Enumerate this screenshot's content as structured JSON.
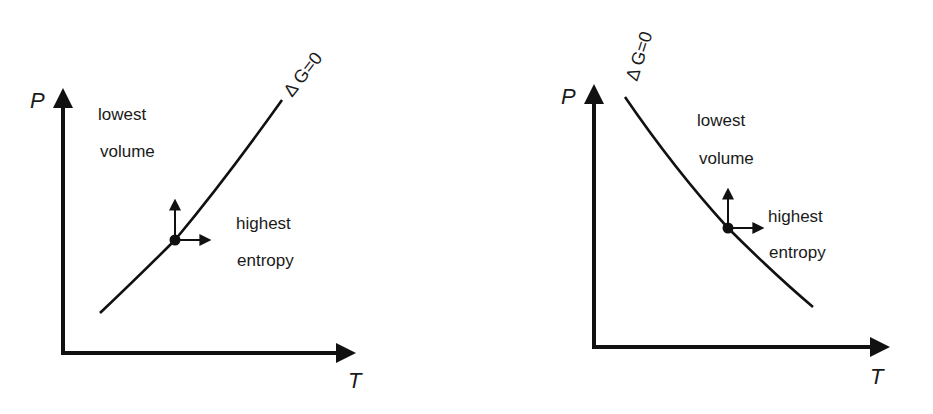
{
  "diagrams": [
    {
      "id": "left",
      "x_axis_label": "T",
      "y_axis_label": "P",
      "curve_label": "Δ G=0",
      "curve_slope": "positive",
      "region_upper_left": [
        "lowest",
        "volume"
      ],
      "region_lower_right": [
        "highest",
        "entropy"
      ],
      "point_arrows": [
        "up",
        "right"
      ]
    },
    {
      "id": "right",
      "x_axis_label": "T",
      "y_axis_label": "P",
      "curve_label": "Δ G=0",
      "curve_slope": "negative",
      "region_upper_right": [
        "lowest",
        "volume"
      ],
      "region_lower_right": [
        "highest",
        "entropy"
      ],
      "point_arrows": [
        "up",
        "right"
      ]
    }
  ],
  "colors": {
    "ink": "#111111",
    "background": "#ffffff"
  }
}
